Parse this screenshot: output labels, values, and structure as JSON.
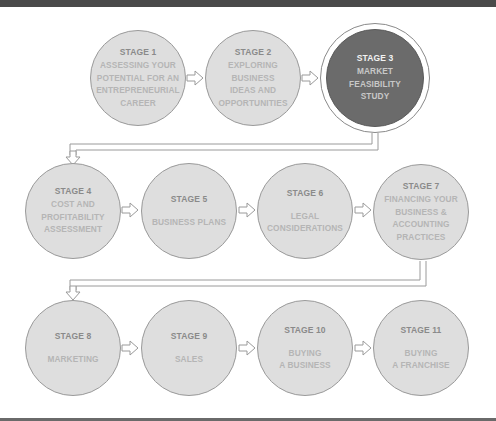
{
  "diagram": {
    "colors": {
      "circle_fill": "#dedede",
      "circle_border": "#9a9a9a",
      "active_fill": "#6b6b6b",
      "connector": "#9a9a9a",
      "label_dark": "#8a8a8a",
      "label_light": "#b5b5b5"
    },
    "stages": [
      {
        "label": "STAGE 1",
        "description": "ASSESSING YOUR\nPOTENTIAL FOR AN\nENTREPRENEURIAL\nCAREER",
        "active": false
      },
      {
        "label": "STAGE 2",
        "description": "EXPLORING\nBUSINESS\nIDEAS AND\nOPPORTUNITIES",
        "active": false
      },
      {
        "label": "STAGE 3",
        "description": "MARKET\nFEASIBILITY\nSTUDY",
        "active": true
      },
      {
        "label": "STAGE 4",
        "description": "COST AND\nPROFITABILITY\nASSESSMENT",
        "active": false
      },
      {
        "label": "STAGE 5",
        "description": "BUSINESS PLANS",
        "active": false
      },
      {
        "label": "STAGE 6",
        "description": "LEGAL\nCONSIDERATIONS",
        "active": false
      },
      {
        "label": "STAGE 7",
        "description": "FINANCING YOUR\nBUSINESS &\nACCOUNTING\nPRACTICES",
        "active": false
      },
      {
        "label": "STAGE 8",
        "description": "MARKETING",
        "active": false
      },
      {
        "label": "STAGE 9",
        "description": "SALES",
        "active": false
      },
      {
        "label": "STAGE 10",
        "description": "BUYING\nA BUSINESS",
        "active": false
      },
      {
        "label": "STAGE 11",
        "description": "BUYING\nA FRANCHISE",
        "active": false
      }
    ]
  }
}
